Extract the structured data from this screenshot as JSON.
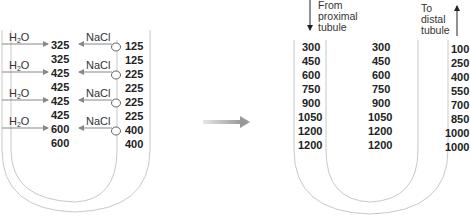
{
  "left_panel": {
    "rows": [
      {
        "water": "H",
        "water_sub": "2",
        "water_tail": "O",
        "salt": "NaCl",
        "desc_top": "325",
        "asc": "125"
      },
      {
        "water": "H",
        "water_sub": "2",
        "water_tail": "O",
        "salt": "NaCl",
        "desc_top": "325",
        "asc": "125"
      }
    ],
    "descending_values": [
      "325",
      "325",
      "425",
      "425",
      "425",
      "425",
      "600",
      "600"
    ],
    "ascending_values": [
      "125",
      "125",
      "225",
      "225",
      "225",
      "225",
      "400",
      "400"
    ],
    "water_label": "H2O",
    "salt_label": "NaCl",
    "label_rows": [
      {
        "h2o": "H2O",
        "nacl": "NaCl"
      },
      {
        "h2o": "H2O",
        "nacl": "NaCl"
      },
      {
        "h2o": "H2O",
        "nacl": "NaCl"
      },
      {
        "h2o": "H2O",
        "nacl": "NaCl"
      }
    ]
  },
  "right_panel": {
    "from_label": [
      "From",
      "proximal",
      "tubule"
    ],
    "to_label": [
      "To",
      "distal",
      "tubule"
    ],
    "descending_values": [
      "300",
      "450",
      "600",
      "750",
      "900",
      "1050",
      "1200",
      "1200"
    ],
    "interstitial_values": [
      "300",
      "450",
      "600",
      "750",
      "900",
      "1050",
      "1200",
      "1200"
    ],
    "ascending_values": [
      "100",
      "250",
      "400",
      "550",
      "700",
      "850",
      "1000",
      "1000"
    ]
  },
  "colors": {
    "tube_outline": "#c8c8c8",
    "arrow_gray": "#888888",
    "transition_arrow": "#9a9a9a",
    "text": "#222222"
  }
}
